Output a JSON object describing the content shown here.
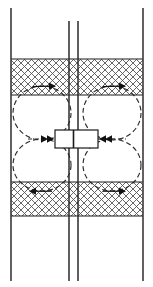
{
  "figure": {
    "width": 153,
    "height": 287,
    "background": "#ffffff"
  },
  "colors": {
    "line": "#1a1a1a",
    "hatch": "#555555",
    "dashed": "#2b2b2b",
    "casing": "#3a3a3a",
    "background": "#ffffff"
  },
  "geometry": {
    "wellbore": {
      "left_wall_x": 68,
      "right_wall_x": 79,
      "top_y": 21,
      "bottom_y": 280,
      "stroke_width": 1.4
    },
    "boundaries": {
      "left_boundary_x": 11,
      "right_boundary_x": 143,
      "top_y": 8,
      "bottom_y": 281,
      "stroke_width": 1.4
    },
    "hatched_bands": [
      {
        "name": "upper-seal-layer",
        "x": 11,
        "y": 59,
        "width": 132,
        "height": 36
      },
      {
        "name": "lower-seal-layer",
        "x": 11,
        "y": 182,
        "width": 132,
        "height": 34
      }
    ],
    "interface_lines": [
      {
        "name": "upper-interface",
        "x1": 11,
        "y1": 95,
        "x2": 143,
        "y2": 95
      },
      {
        "name": "lower-interface",
        "x1": 11,
        "y1": 182,
        "x2": 143,
        "y2": 182
      },
      {
        "name": "upper-band-top",
        "x1": 11,
        "y1": 59,
        "x2": 143,
        "y2": 59
      },
      {
        "name": "lower-band-bottom",
        "x1": 11,
        "y1": 216,
        "x2": 143,
        "y2": 216
      }
    ],
    "perforation_box": {
      "name": "perforation-interval",
      "x": 55,
      "y": 130,
      "width": 43,
      "height": 18
    },
    "convection_cells": [
      {
        "name": "cell-upper-left",
        "cx": 42,
        "cy": 113,
        "rx": 29,
        "ry": 27,
        "rotation": "clockwise"
      },
      {
        "name": "cell-upper-right",
        "cx": 112,
        "cy": 113,
        "rx": 29,
        "ry": 27,
        "rotation": "counter-clockwise"
      },
      {
        "name": "cell-lower-left",
        "cx": 42,
        "cy": 165,
        "rx": 29,
        "ry": 26,
        "rotation": "counter-clockwise"
      },
      {
        "name": "cell-lower-right",
        "cx": 112,
        "cy": 165,
        "rx": 29,
        "ry": 26,
        "rotation": "clockwise"
      }
    ],
    "flow_arrows": [
      {
        "name": "arrow-upper-left-top",
        "x": 43,
        "y": 86,
        "direction": "right"
      },
      {
        "name": "arrow-upper-right-top",
        "x": 113,
        "y": 86,
        "direction": "right"
      },
      {
        "name": "arrow-lower-left-bottom",
        "x": 43,
        "y": 191,
        "direction": "left"
      },
      {
        "name": "arrow-lower-right-bottom",
        "x": 113,
        "y": 191,
        "direction": "right"
      },
      {
        "name": "arrow-inflow-left",
        "x": 50,
        "y": 139,
        "direction": "right"
      },
      {
        "name": "arrow-inflow-right",
        "x": 103,
        "y": 139,
        "direction": "left"
      }
    ],
    "dashed_inflow_lines": [
      {
        "name": "inflow-dash-left",
        "x1": 30,
        "y1": 139,
        "x2": 55,
        "y2": 139
      },
      {
        "name": "inflow-dash-right",
        "x1": 98,
        "y1": 139,
        "x2": 124,
        "y2": 139
      }
    ]
  },
  "style": {
    "dash_pattern": "5 3",
    "hatch_spacing": 7,
    "hatch_stroke_width": 0.9
  }
}
